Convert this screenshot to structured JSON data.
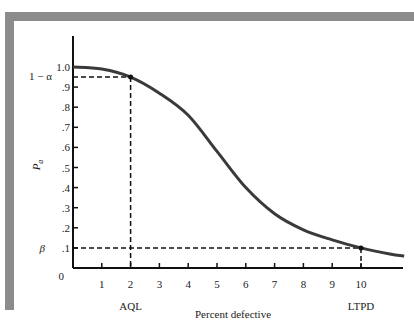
{
  "chart_data": {
    "type": "line",
    "title": "",
    "xlabel": "Percent defective",
    "ylabel": "P_a",
    "xlim": [
      0,
      12.2
    ],
    "ylim": [
      0,
      1.0
    ],
    "grid": false,
    "x_ticks": [
      1,
      2,
      3,
      4,
      5,
      6,
      7,
      8,
      9,
      10
    ],
    "x_tick_labels": [
      "1",
      "2",
      "3",
      "4",
      "5",
      "6",
      "7",
      "8",
      "9",
      "10"
    ],
    "y_ticks": [
      0,
      0.1,
      0.2,
      0.3,
      0.4,
      0.5,
      0.6,
      0.7,
      0.8,
      0.9,
      1.0
    ],
    "y_tick_labels": [
      "0",
      ".1",
      ".2",
      ".3",
      ".4",
      ".5",
      ".6",
      ".7",
      ".8",
      ".9",
      "1.0"
    ],
    "series": [
      {
        "name": "OC curve",
        "x": [
          0,
          1,
          2,
          3,
          4,
          5,
          6,
          7,
          8,
          9,
          10,
          11,
          11.5
        ],
        "y": [
          1.0,
          0.99,
          0.95,
          0.87,
          0.76,
          0.58,
          0.4,
          0.27,
          0.19,
          0.14,
          0.1,
          0.07,
          0.06
        ]
      }
    ],
    "annotations": {
      "alpha_label": "1 − α",
      "beta_label": "β",
      "aql_label": "AQL",
      "ltpd_label": "LTPD",
      "aql_point": {
        "x": 2,
        "y": 0.95
      },
      "ltpd_point": {
        "x": 10,
        "y": 0.1
      }
    }
  }
}
